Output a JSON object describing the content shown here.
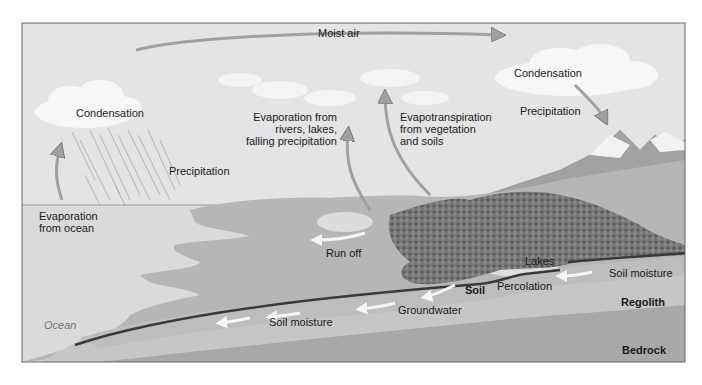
{
  "diagram": {
    "type": "water-cycle",
    "labels": {
      "moist_air": "Moist air",
      "condensation_left": "Condensation",
      "precipitation_left": "Precipitation",
      "evaporation_ocean": [
        "Evaporation",
        "from ocean"
      ],
      "evaporation_rivers": [
        "Evaporation from",
        "rivers, lakes,",
        "falling precipitation"
      ],
      "evapotranspiration": [
        "Evapotranspiration",
        "from vegetation",
        "and soils"
      ],
      "condensation_right": "Condensation",
      "precipitation_right": "Precipitation",
      "run_off": "Run off",
      "lakes": "Lakes",
      "soil_moisture_right": "Soil moisture",
      "soil": "Soil",
      "percolation": "Percolation",
      "regolith": "Regolith",
      "groundwater": "Groundwater",
      "soil_moisture_left": "Soil moisture",
      "ocean": "Ocean",
      "bedrock": "Bedrock"
    },
    "colors": {
      "sky": "#e4e4e4",
      "ocean": "#d9d9d9",
      "land": "#b9b9b9",
      "regolith": "#c4c4c4",
      "bedrock": "#a9a9a9",
      "vegetation": "#6f6f6f",
      "soil_line": "#3a3a3a",
      "arrow": "#9a9a9a",
      "flow_arrow": "#f4f4f4"
    }
  }
}
